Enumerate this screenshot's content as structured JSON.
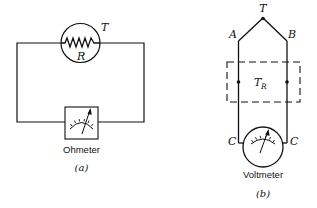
{
  "figure_a": {
    "label_T": "T",
    "label_R": "R",
    "meter_label": "Ohmeter",
    "caption": "(a)"
  },
  "figure_b": {
    "label_T": "T",
    "label_A": "A",
    "label_B": "B",
    "label_TR_main": "T",
    "label_TR_sub": "R",
    "label_C_left": "C",
    "label_C_right": "C",
    "meter_label": "Voltmeter",
    "caption": "(b)"
  },
  "colors": {
    "line": "#111111",
    "background": "#ffffff"
  }
}
